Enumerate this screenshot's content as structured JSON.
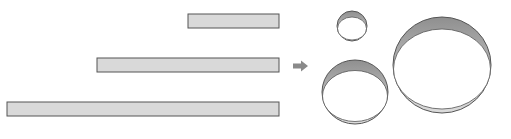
{
  "diagram": {
    "colors": {
      "strip_fill": "#d9d9d9",
      "stroke": "#555555",
      "ring_band_dark": "#9a9a9a",
      "ring_band_light": "#d4d4d4",
      "arrow": "#8a8a8a",
      "background": "#ffffff"
    },
    "strips": [
      {
        "id": "short",
        "x": 188,
        "y": 14,
        "width": 91,
        "height": 14
      },
      {
        "id": "medium",
        "x": 97,
        "y": 58,
        "width": 182,
        "height": 14
      },
      {
        "id": "long",
        "x": 7,
        "y": 102,
        "width": 272,
        "height": 14
      }
    ],
    "arrow": {
      "direction": "right",
      "x": 293,
      "y": 61,
      "width": 15,
      "height": 10
    },
    "rings": [
      {
        "id": "small",
        "cx": 352,
        "cy": 26,
        "rx": 15,
        "ry": 15,
        "band": 5
      },
      {
        "id": "medium",
        "cx": 355,
        "cy": 92,
        "rx": 33,
        "ry": 32,
        "band": 8
      },
      {
        "id": "large",
        "cx": 442,
        "cy": 65,
        "rx": 49,
        "ry": 48,
        "band": 9
      }
    ]
  }
}
